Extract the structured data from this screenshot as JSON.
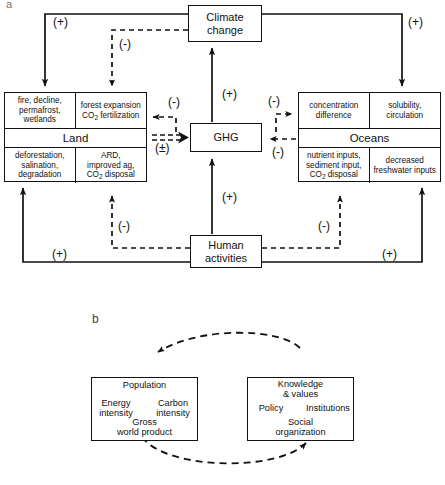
{
  "figure": {
    "panel_a_letter": "a",
    "panel_b_letter": "b"
  },
  "panel_a": {
    "nodes": {
      "climate_change": "Climate\nchange",
      "climate_change_line1": "Climate",
      "climate_change_line2": "change",
      "ghg": "GHG",
      "human_activities_line1": "Human",
      "human_activities_line2": "activities"
    },
    "land": {
      "title": "Land",
      "top_left": "fire, decline,\npermafrost,\nwetlands",
      "top_left_lines": [
        "fire, decline,",
        "permafrost,",
        "wetlands"
      ],
      "top_right_lines": [
        "forest expansion",
        "CO2 fertilization"
      ],
      "top_right_l1": "forest expansion",
      "top_right_l2_pre": "CO",
      "top_right_l2_sub": "2",
      "top_right_l2_post": " fertilization",
      "bottom_left_lines": [
        "deforestation,",
        "salination,",
        "degradation"
      ],
      "bottom_right_l1": "ARD,",
      "bottom_right_l2": "improved ag,",
      "bottom_right_l3_pre": "CO",
      "bottom_right_l3_sub": "2",
      "bottom_right_l3_post": " disposal"
    },
    "oceans": {
      "title": "Oceans",
      "top_left_lines": [
        "concentration",
        "difference"
      ],
      "top_right_lines": [
        "solubility,",
        "circulation"
      ],
      "bottom_left_l1": "nutrient inputs,",
      "bottom_left_l2": "sediment input,",
      "bottom_left_l3_pre": "CO",
      "bottom_left_l3_sub": "2",
      "bottom_left_l3_post": " disposal",
      "bottom_right_lines": [
        "decreased",
        "freshwater inputs"
      ]
    },
    "signs": {
      "climate_to_land_plus": "(+)",
      "climate_to_land_minus": "(-)",
      "climate_to_oceans_plus": "(+)",
      "land_to_ghg_minus": "(-)",
      "land_to_ghg_plusminus": "(±)",
      "ghg_to_climate_plus": "(+)",
      "ghg_to_oceans_minus": "(-)",
      "oceans_to_ghg_minus": "(-)",
      "human_to_ghg_plus": "(+)",
      "human_to_land_plus": "(+)",
      "human_to_land_minus": "(-)",
      "human_to_oceans_plus": "(+)",
      "human_to_oceans_minus": "(-)"
    }
  },
  "panel_b": {
    "left_box": {
      "top": "Population",
      "left_l1": "Energy",
      "left_l2": "intensity",
      "right_l1": "Carbon",
      "right_l2": "intensity",
      "bottom_l1": "Gross",
      "bottom_l2": "world product"
    },
    "right_box": {
      "top_l1": "Knowledge",
      "top_l2": "& values",
      "left": "Policy",
      "right": "Institutions",
      "bottom_l1": "Social",
      "bottom_l2": "organization"
    }
  },
  "colors": {
    "stroke": "#111111",
    "background": "#ffffff"
  }
}
